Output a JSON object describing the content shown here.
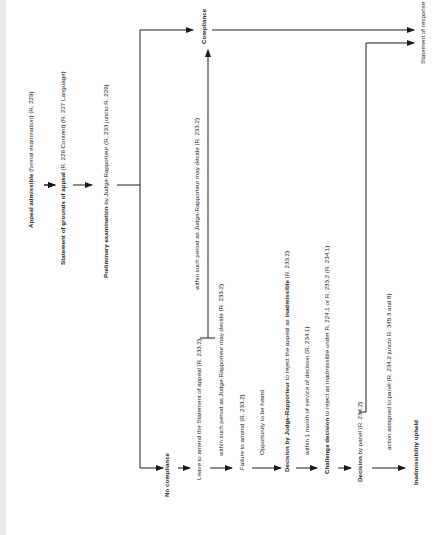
{
  "diagram": {
    "orientation": "rotated-90-ccw",
    "nodes": {
      "appeal_admissible": {
        "bold": "Appeal admissible",
        "rest": " (formal examination) (R. 229)"
      },
      "statement_grounds": {
        "bold": "Statement of grounds of appeal",
        "rest": " (R. 226 Content) (R. 227 Language)"
      },
      "preliminary_exam": {
        "bold": "Preliminary examination",
        "rest": " by Judge-Rapporteur (R. 233 juncto R. 226)"
      },
      "compliance": {
        "bold": "Compliance",
        "rest": ""
      },
      "statement_response": {
        "bold": "",
        "rest": "Statement of response"
      },
      "no_compliance": {
        "bold": "No compliance",
        "rest": ""
      },
      "leave_to_amend": {
        "bold": "",
        "rest": "Leave to amend the Statement of appeal (R. 233.2)"
      },
      "failure_to_amend": {
        "bold": "",
        "rest": "Failure to amend (R. 233.2)"
      },
      "decision_jr": {
        "bold": "Decision by Judge-Rapporteur",
        "rest": " to reject the appeal as ",
        "bold2": "inadmissible",
        "rest2": " (R. 233.2)"
      },
      "challenge_decision": {
        "bold": "Challenge decision",
        "rest": " to reject as inadmissible under R. 224.1 or R. 233.2 (R. 234.1)"
      },
      "decision_panel": {
        "bold": "Decision",
        "rest": " by panel (R. 234.2)"
      },
      "inadmissibility_upheld": {
        "bold": "Inadmissibility upheld",
        "rest": ""
      }
    },
    "edge_labels": {
      "within_period_compliance": "within such period as Judge-Rapporteur may decide (R. 233.2)",
      "within_period_failure": "within such period as Judge-Rapporteur may decide (R. 233.2)",
      "opportunity_heard": "Opportunity to be heard",
      "within_1_month": "within 1 month of service of decision (R. 234.1)",
      "action_assigned": "action assigned to panel (R. 234.2 juncto R. 345.3 and 8)"
    }
  }
}
